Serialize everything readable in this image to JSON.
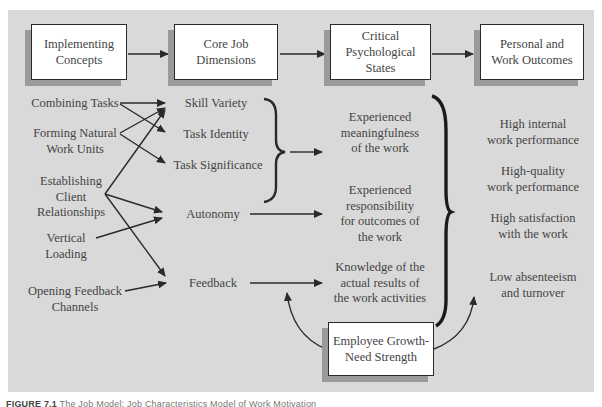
{
  "header_boxes": [
    {
      "id": "implementing",
      "lines": [
        "Implementing",
        "Concepts"
      ]
    },
    {
      "id": "core",
      "lines": [
        "Core Job",
        "Dimensions"
      ]
    },
    {
      "id": "critical",
      "lines": [
        "Critical",
        "Psychological",
        "States"
      ]
    },
    {
      "id": "outcomes",
      "lines": [
        "Personal and",
        "Work Outcomes"
      ]
    }
  ],
  "implementing_concepts": [
    {
      "lines": [
        "Combining Tasks"
      ]
    },
    {
      "lines": [
        "Forming Natural",
        "Work Units"
      ]
    },
    {
      "lines": [
        "Establishing",
        "Client",
        "Relationships"
      ]
    },
    {
      "lines": [
        "Vertical",
        "Loading"
      ]
    },
    {
      "lines": [
        "Opening Feedback",
        "Channels"
      ]
    }
  ],
  "core_dimensions": [
    {
      "lines": [
        "Skill Variety"
      ]
    },
    {
      "lines": [
        "Task Identity"
      ]
    },
    {
      "lines": [
        "Task Significance"
      ]
    },
    {
      "lines": [
        "Autonomy"
      ]
    },
    {
      "lines": [
        "Feedback"
      ]
    }
  ],
  "psychological_states": [
    {
      "lines": [
        "Experienced",
        "meaningfulness",
        "of the work"
      ]
    },
    {
      "lines": [
        "Experienced",
        "responsibility",
        "for outcomes of",
        "the work"
      ]
    },
    {
      "lines": [
        "Knowledge of the",
        "actual results of",
        "the work activities"
      ]
    }
  ],
  "outcomes": [
    {
      "lines": [
        "High internal",
        "work performance"
      ]
    },
    {
      "lines": [
        "High-quality",
        "work performance"
      ]
    },
    {
      "lines": [
        "High satisfaction",
        "with the work"
      ]
    },
    {
      "lines": [
        "Low absenteeism",
        "and turnover"
      ]
    }
  ],
  "moderator": {
    "lines": [
      "Employee Growth-",
      "Need Strength"
    ]
  },
  "connections": [
    {
      "from": "Combining Tasks",
      "to": "Skill Variety"
    },
    {
      "from": "Combining Tasks",
      "to": "Task Identity"
    },
    {
      "from": "Forming Natural Work Units",
      "to": "Task Identity"
    },
    {
      "from": "Forming Natural Work Units",
      "to": "Task Significance"
    },
    {
      "from": "Establishing Client Relationships",
      "to": "Skill Variety"
    },
    {
      "from": "Establishing Client Relationships",
      "to": "Autonomy"
    },
    {
      "from": "Establishing Client Relationships",
      "to": "Feedback"
    },
    {
      "from": "Vertical Loading",
      "to": "Autonomy"
    },
    {
      "from": "Opening Feedback Channels",
      "to": "Feedback"
    }
  ],
  "caption": {
    "label": "FIGURE 7.1",
    "text": "The Job Model: Job Characteristics Model of Work Motivation"
  },
  "colors": {
    "panel": "#d9d9d9",
    "box": "#ffffff",
    "shadow": "#9a9a9a",
    "line": "#2a2a2a",
    "text": "#444444"
  }
}
